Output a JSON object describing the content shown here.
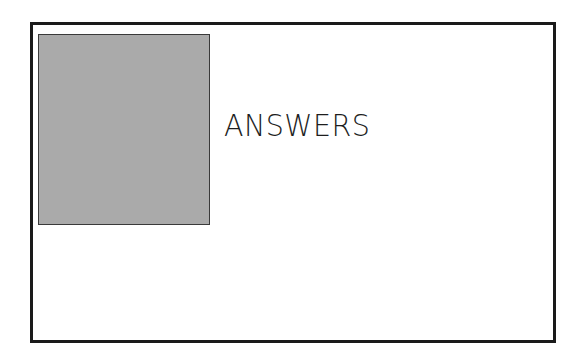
{
  "slide": {
    "title": "ANSWERS",
    "image_placeholder": {
      "fill_color": "#aaaaaa",
      "border_color": "#3a3a3a"
    },
    "frame_border_color": "#1a1a1a"
  }
}
